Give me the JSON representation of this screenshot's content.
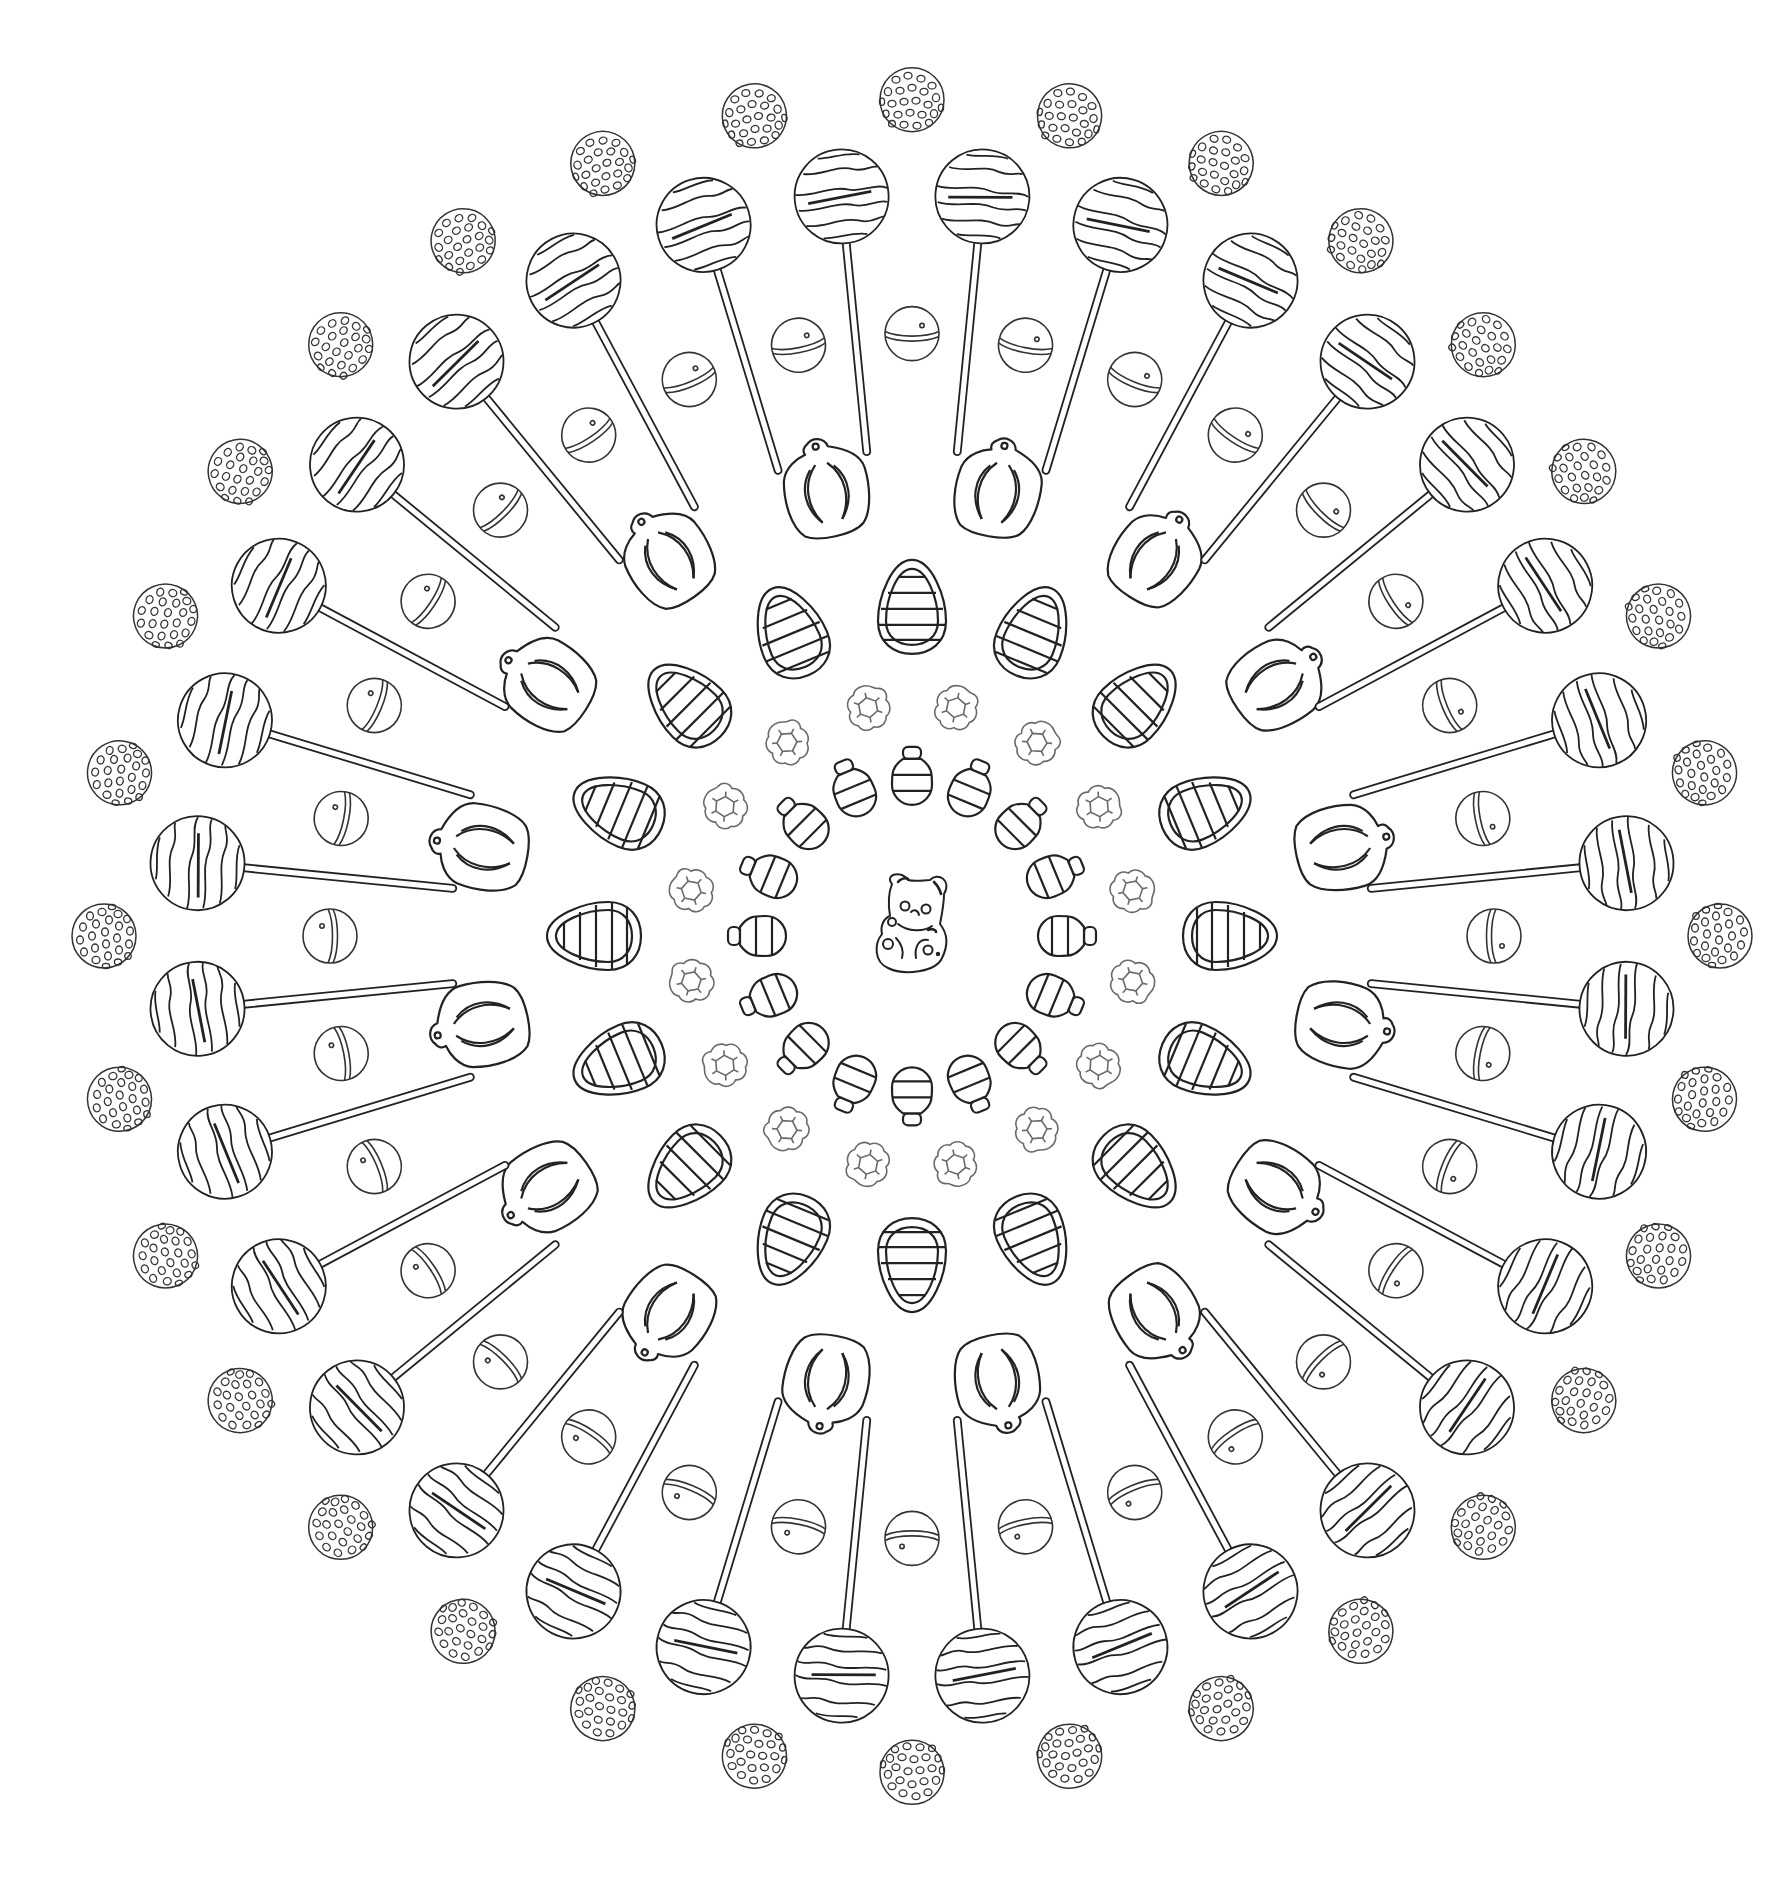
{
  "page": {
    "background": "#ffffff",
    "stroke_color": "#222222",
    "flower_stroke_color": "#6a6a6a"
  },
  "mandala": {
    "center": {
      "x": 912,
      "y": 936
    },
    "y_scale": 1.035,
    "centerpiece": {
      "name": "gummy-bear",
      "x": 914,
      "y": 924,
      "width": 76,
      "height": 100
    },
    "rings": [
      {
        "name": "bell-candy-ring",
        "shape": "bell",
        "count": 16,
        "radius": 150,
        "offset_deg": 0,
        "width": 40,
        "height": 64
      },
      {
        "name": "flower-gummy-ring",
        "shape": "flower",
        "count": 16,
        "radius": 225,
        "offset_deg": 11.25,
        "width": 46,
        "height": 46
      },
      {
        "name": "striped-egg-ring",
        "shape": "egg",
        "count": 16,
        "radius": 318,
        "offset_deg": 0,
        "width": 70,
        "height": 94
      },
      {
        "name": "shell-candy-ring",
        "shape": "shell",
        "count": 16,
        "radius": 440,
        "offset_deg": 11.25,
        "width": 84,
        "height": 100
      },
      {
        "name": "half-ball-ring",
        "shape": "halfball",
        "count": 32,
        "radius": 582,
        "offset_deg": 0,
        "width": 58,
        "height": 56
      },
      {
        "name": "lollipop-ring",
        "shape": "lollipop",
        "count": 32,
        "radius": 718,
        "offset_deg": 5.625,
        "width": 98,
        "height": 320
      },
      {
        "name": "sprinkle-ball-ring",
        "shape": "sprinkle",
        "count": 32,
        "radius": 808,
        "offset_deg": 0,
        "width": 66,
        "height": 66
      }
    ]
  }
}
